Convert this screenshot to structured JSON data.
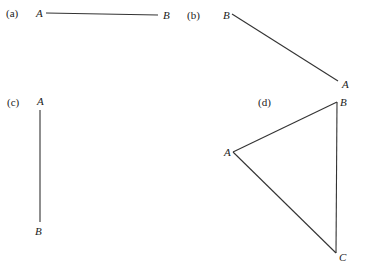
{
  "panels": [
    {
      "label": "(a)",
      "points": [
        {
          "name": "A"
        },
        {
          "name": "B"
        }
      ],
      "segments": [
        "A-B"
      ],
      "description": "horizontal segment from A to B"
    },
    {
      "label": "(b)",
      "points": [
        {
          "name": "B"
        },
        {
          "name": "A"
        }
      ],
      "segments": [
        "B-A"
      ],
      "description": "diagonal segment from B (upper left) to A (lower right)"
    },
    {
      "label": "(c)",
      "points": [
        {
          "name": "A"
        },
        {
          "name": "B"
        }
      ],
      "segments": [
        "A-B"
      ],
      "description": "vertical segment from A (top) to B (bottom)"
    },
    {
      "label": "(d)",
      "points": [
        {
          "name": "B"
        },
        {
          "name": "A"
        },
        {
          "name": "C"
        }
      ],
      "segments": [
        "A-B",
        "B-C",
        "A-C"
      ],
      "description": "triangle ABC"
    }
  ]
}
